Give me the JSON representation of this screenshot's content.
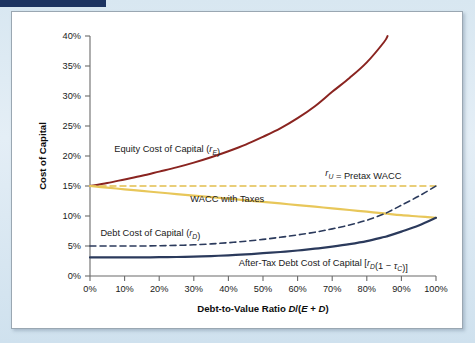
{
  "figure": {
    "accent_bar_color": "#1d3461",
    "card_background": "#ffffff",
    "page_background": "#dce9f2"
  },
  "chart_data": {
    "type": "line",
    "title": "",
    "xlabel_parts": {
      "main": "Debt-to-Value Ratio",
      "formula_lead": "D",
      "formula_slash": "/(",
      "formula_e": "E",
      "formula_plus": " + ",
      "formula_d": "D",
      "formula_close": ")"
    },
    "xlabel": "Debt-to-Value Ratio  D/(E + D)",
    "ylabel": "Cost of Capital",
    "xlim": [
      0,
      100
    ],
    "ylim": [
      0,
      40
    ],
    "grid": false,
    "legend_position": "inline-annotations",
    "xticks": [
      "0%",
      "10%",
      "20%",
      "30%",
      "40%",
      "50%",
      "60%",
      "70%",
      "80%",
      "90%",
      "100%"
    ],
    "xtick_values": [
      0,
      10,
      20,
      30,
      40,
      50,
      60,
      70,
      80,
      90,
      100
    ],
    "yticks": [
      "0%",
      "5%",
      "10%",
      "15%",
      "20%",
      "25%",
      "30%",
      "35%",
      "40%"
    ],
    "ytick_values": [
      0,
      5,
      10,
      15,
      20,
      25,
      30,
      35,
      40
    ],
    "x": [
      0,
      5,
      10,
      15,
      20,
      25,
      30,
      35,
      40,
      45,
      50,
      55,
      60,
      65,
      70,
      75,
      80,
      85,
      86,
      90,
      95,
      100
    ],
    "series": [
      {
        "name": "Equity Cost of Capital (rE)",
        "color": "#8a2420",
        "style": "solid",
        "width": 2.0,
        "clipped_at_top": true,
        "values": [
          15.0,
          15.5,
          16.1,
          16.7,
          17.4,
          18.1,
          18.9,
          19.8,
          20.8,
          21.9,
          23.2,
          24.6,
          26.3,
          28.3,
          30.7,
          33.0,
          35.6,
          39.0,
          40.0,
          null,
          null,
          null
        ]
      },
      {
        "name": "Pretax WACC (rU)",
        "color": "#e2be4e",
        "style": "dashed",
        "width": 1.4,
        "values": [
          15.0,
          15.0,
          15.0,
          15.0,
          15.0,
          15.0,
          15.0,
          15.0,
          15.0,
          15.0,
          15.0,
          15.0,
          15.0,
          15.0,
          15.0,
          15.0,
          15.0,
          15.0,
          15.0,
          15.0,
          15.0,
          15.0
        ]
      },
      {
        "name": "WACC with Taxes",
        "color": "#e8c75a",
        "style": "solid",
        "width": 2.2,
        "values": [
          15.0,
          14.72,
          14.45,
          14.18,
          13.92,
          13.66,
          13.4,
          13.14,
          12.88,
          12.62,
          12.35,
          12.09,
          11.82,
          11.55,
          11.28,
          11.0,
          10.72,
          10.43,
          10.37,
          10.13,
          9.92,
          9.7
        ]
      },
      {
        "name": "Debt Cost of Capital (rD)",
        "color": "#2b3a5c",
        "style": "dashed",
        "width": 1.6,
        "values": [
          5.0,
          5.0,
          5.0,
          5.0,
          5.05,
          5.1,
          5.2,
          5.35,
          5.55,
          5.8,
          6.1,
          6.45,
          6.85,
          7.3,
          7.85,
          8.5,
          9.3,
          10.35,
          10.6,
          11.8,
          13.3,
          15.0
        ]
      },
      {
        "name": "After-Tax Debt Cost of Capital [rD(1 - tC)]",
        "color": "#2b3a5c",
        "style": "solid",
        "width": 2.2,
        "values": [
          3.1,
          3.1,
          3.1,
          3.1,
          3.13,
          3.17,
          3.23,
          3.32,
          3.45,
          3.6,
          3.8,
          4.0,
          4.25,
          4.55,
          4.9,
          5.3,
          5.8,
          6.5,
          6.65,
          7.4,
          8.4,
          9.7
        ]
      }
    ],
    "annotations": [
      {
        "id": "equity-cost-label",
        "text": "Equity Cost of Capital (rE)",
        "text_main": "Equity Cost of Capital (",
        "text_var": "r",
        "text_sub": "E",
        "text_tail": ")",
        "x_pct": 7,
        "y_pct": 20.6
      },
      {
        "id": "pretax-wacc-label",
        "text": "rU = Pretax WACC",
        "text_var": "r",
        "text_sub": "U",
        "text_tail": " = Pretax WACC",
        "x_pct": 68,
        "y_pct": 16.6
      },
      {
        "id": "wacc-with-taxes-label",
        "text": "WACC with Taxes",
        "x_pct": 29,
        "y_pct": 12.3
      },
      {
        "id": "debt-cost-label",
        "text": "Debt Cost of Capital (rD)",
        "text_main": "Debt Cost of Capital (",
        "text_var": "r",
        "text_sub": "D",
        "text_tail": ")",
        "x_pct": 3,
        "y_pct": 6.6
      },
      {
        "id": "after-tax-debt-cost-label",
        "text": "After-Tax Debt Cost of Capital [rD(1 - tC)]",
        "text_main": "After-Tax Debt Cost of Capital [",
        "text_var": "r",
        "text_sub": "D",
        "text_mid": "(1 − ",
        "text_var2": "τ",
        "text_sub2": "C",
        "text_tail": ")]",
        "x_pct": 43,
        "y_pct": 1.6
      }
    ]
  }
}
